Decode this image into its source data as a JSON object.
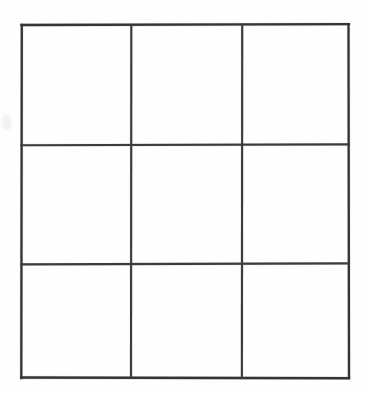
{
  "document": {
    "kind": "scanned-line-drawing",
    "description": "Empty 3 by 3 grid of squares drawn in black ink on white paper",
    "background_color": "#ffffff",
    "paper_color": "#fefefe"
  },
  "grid": {
    "rows": 3,
    "columns": 3,
    "cell_count": 9,
    "line_color": "#2a2a2a",
    "line_width_px": 2,
    "bounds": {
      "left": 21,
      "top": 24,
      "right": 349,
      "bottom": 378,
      "width": 328,
      "height": 354
    },
    "vertical_divider_x": [
      131,
      242
    ],
    "horizontal_divider_y": [
      145,
      264
    ],
    "column_edges_x": [
      21,
      131,
      242,
      349
    ],
    "row_edges_y": [
      24,
      145,
      264,
      378
    ],
    "cells": [
      {
        "id": "r1c1",
        "row": 1,
        "column": 1,
        "content": "",
        "x": 21,
        "y": 24,
        "width": 110,
        "height": 121
      },
      {
        "id": "r1c2",
        "row": 1,
        "column": 2,
        "content": "",
        "x": 131,
        "y": 24,
        "width": 111,
        "height": 121
      },
      {
        "id": "r1c3",
        "row": 1,
        "column": 3,
        "content": "",
        "x": 242,
        "y": 24,
        "width": 107,
        "height": 121
      },
      {
        "id": "r2c1",
        "row": 2,
        "column": 1,
        "content": "",
        "x": 21,
        "y": 145,
        "width": 110,
        "height": 119
      },
      {
        "id": "r2c2",
        "row": 2,
        "column": 2,
        "content": "",
        "x": 131,
        "y": 145,
        "width": 111,
        "height": 119
      },
      {
        "id": "r2c3",
        "row": 2,
        "column": 3,
        "content": "",
        "x": 242,
        "y": 145,
        "width": 107,
        "height": 119
      },
      {
        "id": "r3c1",
        "row": 3,
        "column": 1,
        "content": "",
        "x": 21,
        "y": 264,
        "width": 110,
        "height": 114
      },
      {
        "id": "r3c2",
        "row": 3,
        "column": 2,
        "content": "",
        "x": 131,
        "y": 264,
        "width": 111,
        "height": 114
      },
      {
        "id": "r3c3",
        "row": 3,
        "column": 3,
        "content": "",
        "x": 242,
        "y": 264,
        "width": 107,
        "height": 114
      }
    ]
  },
  "artifacts": {
    "smudge": {
      "name": "left-margin-smudge",
      "color": "#f2f2f2",
      "x": 2,
      "y": 114,
      "width": 9,
      "height": 15
    }
  }
}
